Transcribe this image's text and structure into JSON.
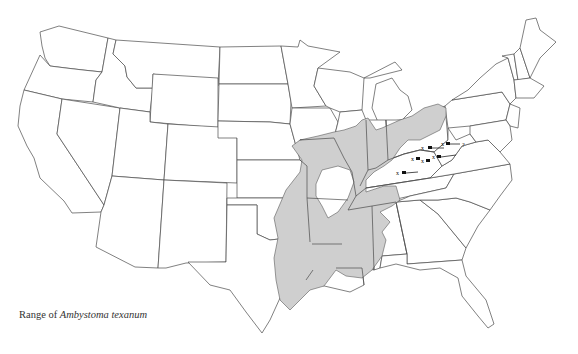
{
  "page_header": {
    "page_number_fragment": "",
    "running_title_fragment": ""
  },
  "map": {
    "title": "Range of Ambystoma texanum",
    "caption_prefix": "Range of",
    "caption_species": "Ambystoma texanum",
    "region": "Contiguous United States",
    "range_fill_color": "#cfcfcf",
    "outline_color": "#4a4a4a",
    "background_color": "#ffffff",
    "legend": {
      "shaded_area": "Range",
      "x_markers": "Isolated locality records",
      "arrows": "Pointers to isolated localities"
    },
    "isolated_records": [
      {
        "id": 1,
        "label": "x"
      },
      {
        "id": 2,
        "label": "x"
      },
      {
        "id": 3,
        "label": "x"
      },
      {
        "id": 4,
        "label": "x"
      },
      {
        "id": 5,
        "label": "x"
      },
      {
        "id": 6,
        "label": "x"
      },
      {
        "id": 7,
        "label": "?"
      }
    ]
  }
}
